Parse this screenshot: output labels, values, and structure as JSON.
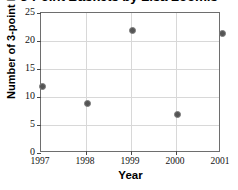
{
  "chart_data": {
    "type": "scatter",
    "title": "3-Point Baskets by Lisa Loomis",
    "xlabel": "Year",
    "ylabel": "Number of 3-point baskets",
    "x": [
      1997,
      1998,
      1999,
      2000,
      2001
    ],
    "values": [
      12,
      9,
      22,
      7,
      21.5
    ],
    "categories": [
      "1997",
      "1998",
      "1999",
      "2000",
      "2001"
    ],
    "xtick_labels": [
      "1997",
      "1998",
      "1999",
      "2000",
      "2001"
    ],
    "ytick_labels": [
      "0",
      "5",
      "10",
      "15",
      "20",
      "25"
    ],
    "ytick_values": [
      0,
      5,
      10,
      15,
      20,
      25
    ],
    "xlim": [
      1997,
      2001
    ],
    "ylim": [
      0,
      25
    ],
    "grid": true,
    "legend": false,
    "legend_position": "none",
    "marker_color": "#555555",
    "gridline_color": "#d8d8d8",
    "frame_color": "#6e6e6e",
    "points": [
      {
        "year": "1997",
        "baskets": 12
      },
      {
        "year": "1998",
        "baskets": 9
      },
      {
        "year": "1999",
        "baskets": 22
      },
      {
        "year": "2000",
        "baskets": 7
      },
      {
        "year": "2001",
        "baskets": 21.5
      }
    ]
  }
}
